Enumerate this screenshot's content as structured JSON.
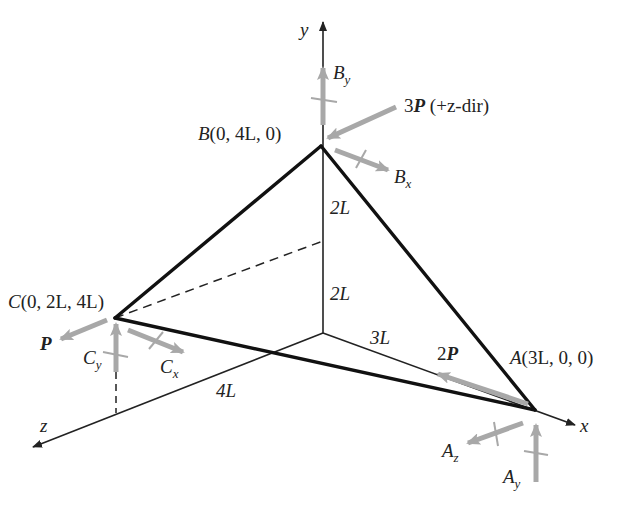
{
  "figure": {
    "type": "3D truss free-body diagram",
    "axes": {
      "x": "x",
      "y": "y",
      "z": "z"
    },
    "points": {
      "A": {
        "name": "A",
        "coords": "(3L, 0, 0)"
      },
      "B": {
        "name": "B",
        "coords": "(0, 4L, 0)"
      },
      "C": {
        "name": "C",
        "coords": "(0, 2L, 4L)"
      }
    },
    "dimensions": {
      "y_upper": "2L",
      "y_lower": "2L",
      "x_length": "3L",
      "z_length": "4L"
    },
    "loads": {
      "at_B": {
        "magnitude": "3",
        "symbol": "P",
        "note": " (+z-dir)"
      },
      "at_C": {
        "symbol": "P"
      },
      "at_A": {
        "magnitude": "2",
        "symbol": "P"
      }
    },
    "reactions": {
      "B": [
        {
          "base": "B",
          "sub": "y"
        },
        {
          "base": "B",
          "sub": "x"
        }
      ],
      "C": [
        {
          "base": "C",
          "sub": "y"
        },
        {
          "base": "C",
          "sub": "x"
        }
      ],
      "A": [
        {
          "base": "A",
          "sub": "z"
        },
        {
          "base": "A",
          "sub": "y"
        }
      ]
    },
    "colors": {
      "member": "#111111",
      "axis": "#222222",
      "force": "#a8a8a8",
      "background": "#ffffff"
    }
  }
}
